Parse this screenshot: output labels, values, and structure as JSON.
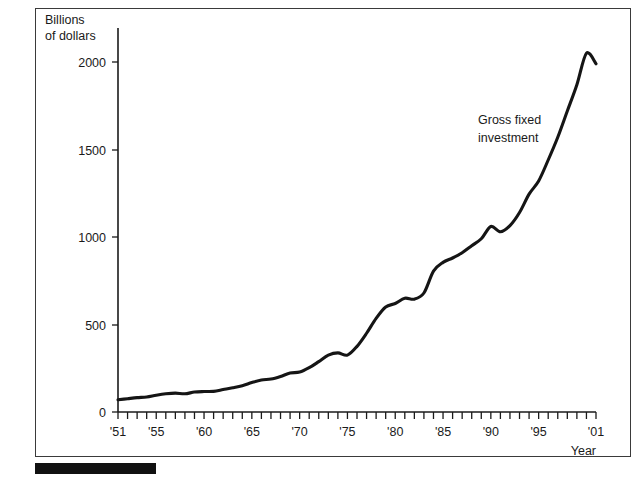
{
  "figure": {
    "background_color": "#ffffff",
    "border_color": "#3a3a3a",
    "accent_color": "#151515",
    "footer_bar_color": "#111111"
  },
  "chart_data": {
    "type": "line",
    "title": "",
    "subtitle": "",
    "ylabel_line1": "Billions",
    "ylabel_line2": "of dollars",
    "xlabel": "Year",
    "ylabel": "Billions of dollars",
    "xlim": [
      1951,
      2001
    ],
    "ylim": [
      0,
      2150
    ],
    "grid": false,
    "legend": "none",
    "y_ticks": [
      0,
      500,
      1000,
      1500,
      2000
    ],
    "y_tick_labels": [
      "0",
      "500",
      "1000",
      "1500",
      "2000"
    ],
    "x_tick_years": [
      1951,
      1952,
      1953,
      1954,
      1955,
      1956,
      1957,
      1958,
      1959,
      1960,
      1961,
      1962,
      1963,
      1964,
      1965,
      1966,
      1967,
      1968,
      1969,
      1970,
      1971,
      1972,
      1973,
      1974,
      1975,
      1976,
      1977,
      1978,
      1979,
      1980,
      1981,
      1982,
      1983,
      1984,
      1985,
      1986,
      1987,
      1988,
      1989,
      1990,
      1991,
      1992,
      1993,
      1994,
      1995,
      1996,
      1997,
      1998,
      1999,
      2000,
      2001
    ],
    "x_labeled_years": [
      1951,
      1955,
      1960,
      1965,
      1970,
      1975,
      1980,
      1985,
      1990,
      1995,
      2001
    ],
    "x_tick_labels": [
      "'51",
      "'55",
      "'60",
      "'65",
      "'70",
      "'75",
      "'80",
      "'85",
      "'90",
      "'95",
      "'01"
    ],
    "annotations": [
      {
        "text_line1": "Gross fixed",
        "text_line2": "investment",
        "year": 1994,
        "value": 1580
      }
    ],
    "series": [
      {
        "name": "Gross fixed investment",
        "x": [
          1951,
          1952,
          1953,
          1954,
          1955,
          1956,
          1957,
          1958,
          1959,
          1960,
          1961,
          1962,
          1963,
          1964,
          1965,
          1966,
          1967,
          1968,
          1969,
          1970,
          1971,
          1972,
          1973,
          1974,
          1975,
          1976,
          1977,
          1978,
          1979,
          1980,
          1981,
          1982,
          1983,
          1984,
          1985,
          1986,
          1987,
          1988,
          1989,
          1990,
          1991,
          1992,
          1993,
          1994,
          1995,
          1996,
          1997,
          1998,
          1999,
          2000,
          2001
        ],
        "values": [
          70,
          76,
          82,
          86,
          96,
          104,
          108,
          104,
          114,
          117,
          118,
          128,
          138,
          150,
          168,
          183,
          188,
          203,
          223,
          228,
          253,
          288,
          325,
          338,
          325,
          375,
          450,
          535,
          600,
          620,
          650,
          645,
          680,
          805,
          855,
          880,
          910,
          950,
          990,
          1060,
          1030,
          1065,
          1140,
          1245,
          1320,
          1440,
          1570,
          1720,
          1870,
          2050,
          1990
        ]
      }
    ]
  }
}
